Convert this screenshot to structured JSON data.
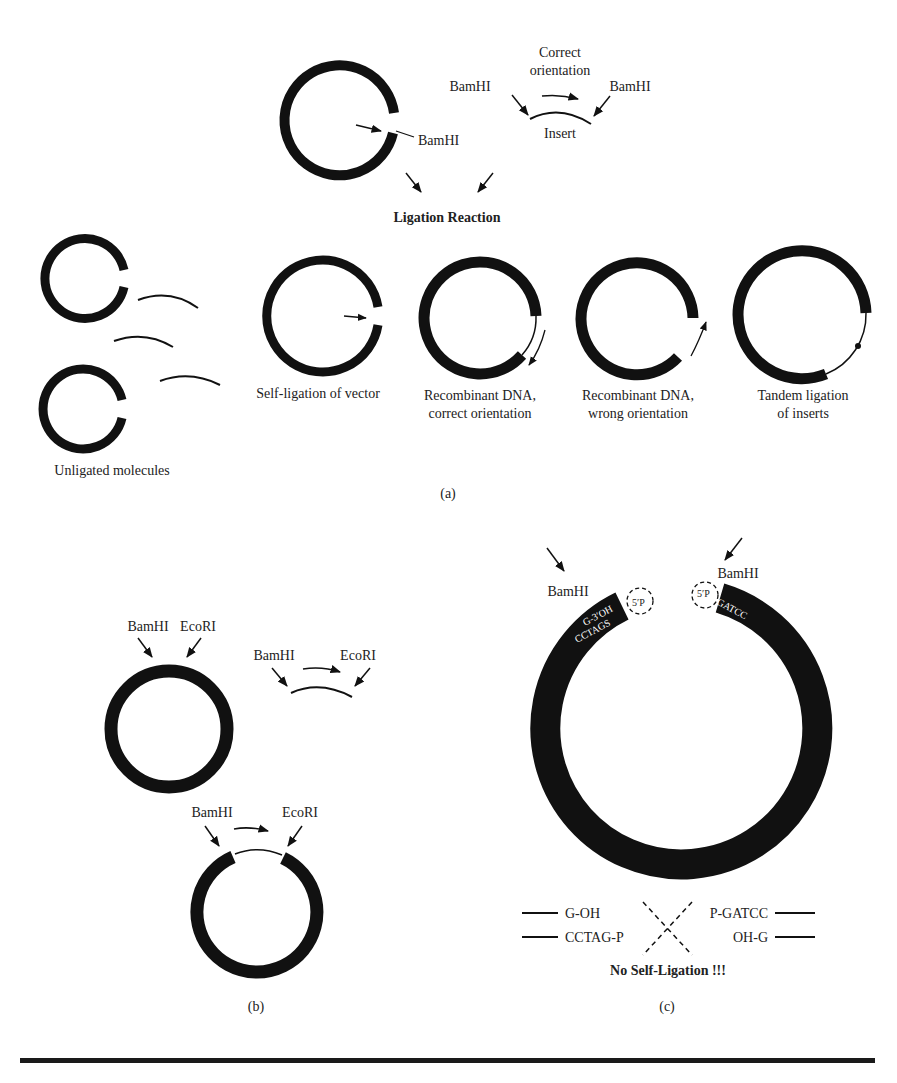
{
  "panel_a": {
    "label": "(a)",
    "vector_site": "BamHI",
    "insert": {
      "title_line1": "Correct",
      "title_line2": "orientation",
      "left_site": "BamHI",
      "right_site": "BamHI",
      "label": "Insert"
    },
    "reaction_label": "Ligation Reaction",
    "unligated_label": "Unligated molecules",
    "products": [
      {
        "line1": "Self-ligation of vector",
        "line2": ""
      },
      {
        "line1": "Recombinant DNA,",
        "line2": "correct orientation"
      },
      {
        "line1": "Recombinant DNA,",
        "line2": "wrong orientation"
      },
      {
        "line1": "Tandem ligation",
        "line2": "of inserts"
      }
    ]
  },
  "panel_b": {
    "label": "(b)",
    "vector_sites": [
      "BamHI",
      "EcoRI"
    ],
    "insert_sites": [
      "BamHI",
      "EcoRI"
    ],
    "product_sites": [
      "BamHI",
      "EcoRI"
    ]
  },
  "panel_c": {
    "label": "(c)",
    "left_site": "BamHI",
    "right_site": "BamHI",
    "left_end_top": "G-3′OH",
    "left_end_bottom": "CCTAGS",
    "left_phosphate": "5′P",
    "right_phosphate": "5′P",
    "right_end_top": "GATCC",
    "right_end_bottom": "3′OH C",
    "scheme_left_top": "G-OH",
    "scheme_left_bottom": "CCTAG-P",
    "scheme_right_top": "P-GATCC",
    "scheme_right_bottom": "OH-G",
    "conclusion": "No Self-Ligation !!!"
  },
  "colors": {
    "ink": "#111111",
    "text": "#222222",
    "background": "#ffffff"
  }
}
